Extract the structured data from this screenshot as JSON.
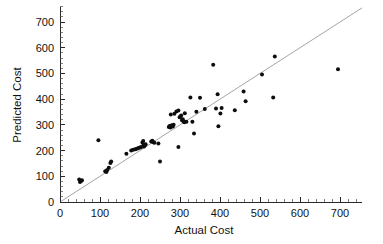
{
  "chart_data": {
    "type": "scatter",
    "title": "",
    "xlabel": "Actual Cost",
    "ylabel": "Predicted Cost",
    "xlim": [
      0,
      755
    ],
    "ylim": [
      0,
      760
    ],
    "xticks": [
      0,
      100,
      200,
      300,
      400,
      500,
      600,
      700
    ],
    "yticks": [
      0,
      100,
      200,
      300,
      400,
      500,
      600,
      700
    ],
    "xtick_labels": [
      "0",
      "100",
      "200",
      "300",
      "400",
      "500",
      "600",
      "700"
    ],
    "ytick_labels": [
      "0",
      "100",
      "200",
      "300",
      "400",
      "500",
      "600",
      "700"
    ],
    "grid": false,
    "legend": null,
    "minor_tick_interval": 20,
    "marker": "filled-circle",
    "marker_color": "#0d0d0d",
    "marker_size": 2.0,
    "reference_line": {
      "name": "identity-line",
      "type": "line",
      "equation": "y = x",
      "color": "#9a9a9a",
      "x": [
        0,
        755
      ],
      "y": [
        0,
        755
      ]
    },
    "points": [
      [
        48,
        88
      ],
      [
        50,
        78
      ],
      [
        53,
        82
      ],
      [
        55,
        85
      ],
      [
        96,
        240
      ],
      [
        113,
        120
      ],
      [
        116,
        117
      ],
      [
        118,
        124
      ],
      [
        122,
        133
      ],
      [
        126,
        152
      ],
      [
        128,
        158
      ],
      [
        166,
        188
      ],
      [
        178,
        200
      ],
      [
        183,
        203
      ],
      [
        188,
        205
      ],
      [
        192,
        207
      ],
      [
        196,
        210
      ],
      [
        200,
        212
      ],
      [
        203,
        214
      ],
      [
        206,
        231
      ],
      [
        208,
        237
      ],
      [
        209,
        222
      ],
      [
        210,
        216
      ],
      [
        212,
        220
      ],
      [
        214,
        225
      ],
      [
        228,
        235
      ],
      [
        231,
        238
      ],
      [
        233,
        232
      ],
      [
        236,
        230
      ],
      [
        246,
        228
      ],
      [
        250,
        158
      ],
      [
        272,
        292
      ],
      [
        274,
        296
      ],
      [
        276,
        290
      ],
      [
        278,
        297
      ],
      [
        280,
        299
      ],
      [
        282,
        294
      ],
      [
        284,
        300
      ],
      [
        277,
        340
      ],
      [
        286,
        343
      ],
      [
        291,
        352
      ],
      [
        296,
        356
      ],
      [
        299,
        330
      ],
      [
        301,
        333
      ],
      [
        303,
        336
      ],
      [
        305,
        318
      ],
      [
        307,
        322
      ],
      [
        309,
        313
      ],
      [
        312,
        345
      ],
      [
        296,
        214
      ],
      [
        311,
        310
      ],
      [
        316,
        312
      ],
      [
        326,
        406
      ],
      [
        331,
        312
      ],
      [
        335,
        266
      ],
      [
        341,
        351
      ],
      [
        350,
        405
      ],
      [
        362,
        362
      ],
      [
        383,
        534
      ],
      [
        390,
        364
      ],
      [
        394,
        419
      ],
      [
        396,
        295
      ],
      [
        401,
        344
      ],
      [
        404,
        366
      ],
      [
        437,
        357
      ],
      [
        459,
        430
      ],
      [
        464,
        392
      ],
      [
        505,
        496
      ],
      [
        533,
        406
      ],
      [
        537,
        566
      ],
      [
        695,
        516
      ]
    ]
  },
  "figure": {
    "width": 383,
    "height": 244,
    "background": "#ffffff",
    "axis_color": "#2b2b2b"
  }
}
